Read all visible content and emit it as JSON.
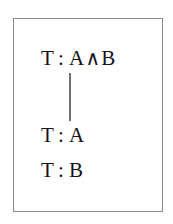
{
  "figure": {
    "name": "conjunction-tableau-rule",
    "frame": {
      "border_color": "#8a8a8a",
      "background": "#ffffff"
    },
    "text_color": "#15131a",
    "edge_color": "#6f6f74"
  },
  "nodes": {
    "premise": {
      "sign": "T",
      "colon": ":",
      "left_operand": "A",
      "connective": "∧",
      "right_operand": "B",
      "full_text": "T : A∧B"
    },
    "conclusion_a": {
      "sign": "T",
      "colon": ":",
      "formula": "A",
      "full_text": "T : A"
    },
    "conclusion_b": {
      "sign": "T",
      "colon": ":",
      "formula": "B",
      "full_text": "T : B"
    }
  },
  "edges": [
    {
      "name": "premise-to-conclusions",
      "from": "premise",
      "to": "conclusion_a",
      "style": "vertical-line"
    }
  ]
}
